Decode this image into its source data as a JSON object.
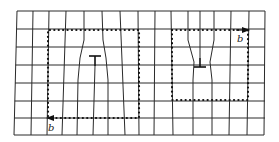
{
  "figure": {
    "lattice": {
      "rows": 7,
      "columns": 14,
      "top_y": 11,
      "bottom_y": 135,
      "row_y": [
        11,
        29,
        47,
        65,
        83,
        101,
        118,
        135
      ]
    },
    "left_panel": {
      "dislocation_symbol": "T",
      "dislocation_position": {
        "x": 95,
        "y": 58
      },
      "burgers_vector_label": "b",
      "burgers_arrow_direction": "left",
      "circuit": {
        "x1": 48,
        "y1": 30,
        "x2": 139,
        "y2": 118
      }
    },
    "right_panel": {
      "dislocation_symbol": "⊥",
      "dislocation_position": {
        "x": 200,
        "y": 60
      },
      "burgers_vector_label": "b",
      "burgers_arrow_direction": "right",
      "circuit": {
        "x1": 172,
        "y1": 30,
        "x2": 248,
        "y2": 100
      }
    },
    "colors": {
      "line": "#2a2a2a",
      "circuit": "#111111",
      "background": "#ffffff"
    }
  }
}
